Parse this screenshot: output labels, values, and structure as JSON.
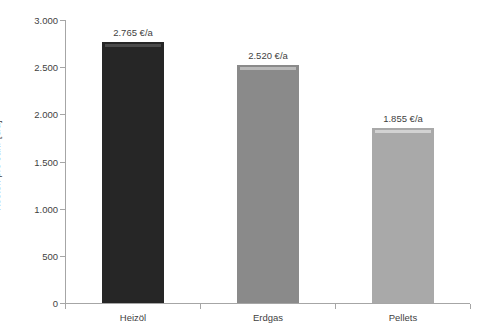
{
  "chart_data": {
    "type": "bar",
    "title": "",
    "subtitle": "",
    "xlabel": "",
    "ylabel": "Kosten pro Jahr [€/a]",
    "categories": [
      "Heizöl",
      "Erdgas",
      "Pellets"
    ],
    "values": [
      2765,
      2520,
      1855
    ],
    "data_labels": [
      "2.765 €/a",
      "2.520 €/a",
      "1.855 €/a"
    ],
    "series": [
      {
        "name": "Kosten pro Jahr",
        "values": [
          2765,
          2520,
          1855
        ],
        "colors": [
          "#262626",
          "#8a8a8a",
          "#a9a9a9"
        ]
      }
    ],
    "ylim": [
      0,
      3000
    ],
    "ytick_values": [
      0,
      500,
      1000,
      1500,
      2000,
      2500,
      3000
    ],
    "ytick_labels": [
      "0",
      "500",
      "1.000",
      "1.500",
      "2.000",
      "2.500",
      "3.000"
    ],
    "grid": false,
    "legend": false,
    "legend_position": "none",
    "axis_color": "#a6a6a6",
    "text_color": "#3f3f3f",
    "background": "#ffffff"
  },
  "axis": {
    "y_title": "Kosten pro Jahr [€/a]"
  },
  "ticks": {
    "y": [
      {
        "label": "3.000",
        "value": 3000
      },
      {
        "label": "2.500",
        "value": 2500
      },
      {
        "label": "2.000",
        "value": 2000
      },
      {
        "label": "1.500",
        "value": 1500
      },
      {
        "label": "1.000",
        "value": 1000
      },
      {
        "label": "500",
        "value": 500
      },
      {
        "label": "0",
        "value": 0
      }
    ]
  },
  "bars": [
    {
      "category": "Heizöl",
      "value": 2765,
      "label": "2.765 €/a",
      "color": "#262626",
      "highlight": "#4a4a4a"
    },
    {
      "category": "Erdgas",
      "value": 2520,
      "label": "2.520 €/a",
      "color": "#8a8a8a",
      "highlight": "#b9b9b9"
    },
    {
      "category": "Pellets",
      "value": 1855,
      "label": "1.855 €/a",
      "color": "#a9a9a9",
      "highlight": "#d2d2d2"
    }
  ]
}
